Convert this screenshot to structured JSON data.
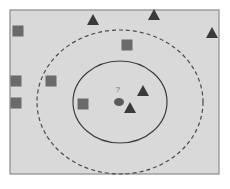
{
  "diagram": {
    "type": "knn-classification",
    "query_label": "?",
    "colors": {
      "background": "#d9d9d9",
      "frame": "#8a8a8a",
      "square": "#6a6a6a",
      "triangle": "#3a3a3a",
      "query": "#5a5a5a",
      "inner_circle": "#3c3c3c",
      "outer_circle": "#4a4a4a"
    },
    "query_point": {
      "shape": "ellipse",
      "x": 119,
      "y": 102
    },
    "inner_boundary": {
      "style": "solid",
      "cx": 120,
      "cy": 102,
      "rx": 47,
      "ry": 41,
      "label": "k=3"
    },
    "outer_boundary": {
      "style": "dashed",
      "cx": 120,
      "cy": 102,
      "rx": 83,
      "ry": 72,
      "label": "k=5"
    },
    "points": [
      {
        "class": "square",
        "x": 18,
        "y": 31
      },
      {
        "class": "square",
        "x": 127,
        "y": 45
      },
      {
        "class": "square",
        "x": 16,
        "y": 81
      },
      {
        "class": "square",
        "x": 51,
        "y": 81
      },
      {
        "class": "square",
        "x": 16,
        "y": 103
      },
      {
        "class": "square",
        "x": 83,
        "y": 104
      },
      {
        "class": "triangle",
        "x": 93,
        "y": 20
      },
      {
        "class": "triangle",
        "x": 154,
        "y": 15
      },
      {
        "class": "triangle",
        "x": 212,
        "y": 33
      },
      {
        "class": "triangle",
        "x": 143,
        "y": 91
      },
      {
        "class": "triangle",
        "x": 130,
        "y": 108
      }
    ]
  }
}
